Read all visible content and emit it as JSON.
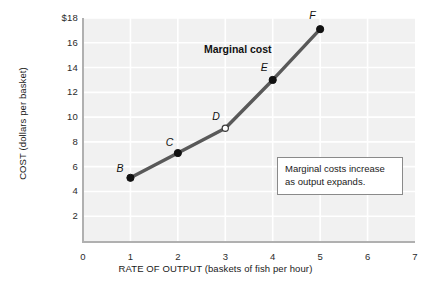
{
  "chart_data": {
    "type": "line",
    "title": "",
    "xlabel": "RATE OF OUTPUT (baskets of fish per hour)",
    "ylabel": "COST (dollars per basket)",
    "xlim": [
      0,
      7
    ],
    "ylim": [
      0,
      18
    ],
    "grid": true,
    "legend_position": "inline-label",
    "series_label": "Marginal cost",
    "series": [
      {
        "name": "Marginal cost",
        "color": "#595959",
        "x": [
          1,
          2,
          3,
          4,
          5
        ],
        "values": [
          5.1,
          7.1,
          9.1,
          13.0,
          17.1
        ],
        "point_labels": [
          "B",
          "C",
          "D",
          "E",
          "F"
        ],
        "point_styles": [
          "filled",
          "filled",
          "open",
          "filled",
          "filled"
        ]
      }
    ],
    "xticks": [
      {
        "value": 0,
        "label": "0"
      },
      {
        "value": 1,
        "label": "1"
      },
      {
        "value": 2,
        "label": "2"
      },
      {
        "value": 3,
        "label": "3"
      },
      {
        "value": 4,
        "label": "4"
      },
      {
        "value": 5,
        "label": "5"
      },
      {
        "value": 6,
        "label": "6"
      },
      {
        "value": 7,
        "label": "7"
      }
    ],
    "yticks": [
      {
        "value": 2,
        "label": "2"
      },
      {
        "value": 4,
        "label": "4"
      },
      {
        "value": 6,
        "label": "6"
      },
      {
        "value": 8,
        "label": "8"
      },
      {
        "value": 10,
        "label": "10"
      },
      {
        "value": 12,
        "label": "12"
      },
      {
        "value": 14,
        "label": "14"
      },
      {
        "value": 16,
        "label": "16"
      },
      {
        "value": 18,
        "label": "$18"
      }
    ],
    "annotations": [
      {
        "name": "marginal-cost-note",
        "lines": [
          "Marginal costs increase",
          "as output expands."
        ]
      }
    ],
    "colors": {
      "plot_background": "#f1f1f1",
      "gridline": "#ffffff",
      "axis": "#b0b0b0",
      "line": "#595959",
      "point_fill": "#111111",
      "text": "#1a1a1a"
    }
  }
}
